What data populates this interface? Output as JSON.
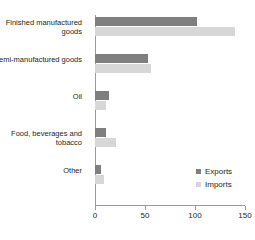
{
  "chart_data": {
    "type": "bar",
    "orientation": "horizontal",
    "title": "",
    "xlabel": "",
    "ylabel": "",
    "xlim": [
      0,
      150
    ],
    "xticks": [
      0,
      50,
      100,
      150
    ],
    "xtick_labels": [
      "0",
      "50",
      "100",
      "150"
    ],
    "grid": false,
    "legend_position": "inside-right",
    "categories": [
      "Finished manufactured goods",
      "Semi-manufactured goods",
      "Oil",
      "Food, beverages and tobacco",
      "Other"
    ],
    "series": [
      {
        "name": "Exports",
        "color": "#7f7f7f",
        "values": [
          102,
          53,
          14,
          11,
          6
        ]
      },
      {
        "name": "Imports",
        "color": "#d7d7d7",
        "values": [
          140,
          56,
          11,
          21,
          9
        ]
      }
    ]
  },
  "legend": {
    "items": [
      {
        "label": "Exports",
        "color": "#7f7f7f"
      },
      {
        "label": "Imports",
        "color": "#d7d7d7"
      }
    ]
  },
  "axis": {
    "line_color": "#9a9a9a"
  }
}
